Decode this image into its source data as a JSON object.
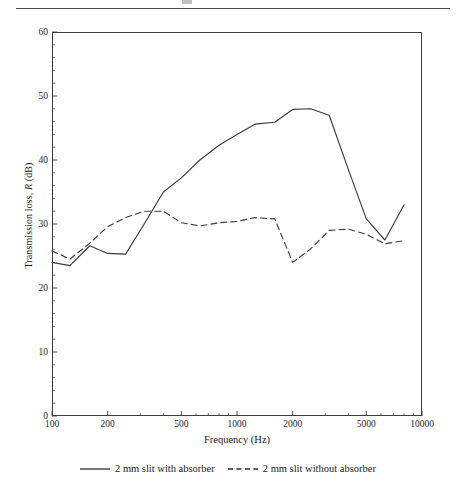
{
  "page": {
    "header_rule": true,
    "top_glyph": "cut-off-text-fragment"
  },
  "figure": {
    "x_axis_title": "Frequency (Hz)",
    "y_axis_title_pre": "Transmission loss, ",
    "y_axis_title_ital": "R",
    "y_axis_title_post": " (dB)"
  },
  "legend": {
    "items": [
      {
        "label": "2 mm slit with absorber",
        "style": "solid"
      },
      {
        "label": "2 mm slit without absorber",
        "style": "dashed"
      }
    ]
  },
  "chart_data": {
    "type": "line",
    "title": "",
    "xlabel": "Frequency (Hz)",
    "ylabel": "Transmission loss, R (dB)",
    "xscale": "log",
    "xlim": [
      100,
      10000
    ],
    "ylim": [
      0,
      60
    ],
    "yticks": [
      0,
      10,
      20,
      30,
      40,
      50,
      60
    ],
    "xticks": [
      100,
      200,
      500,
      1000,
      2000,
      5000,
      10000
    ],
    "xticklabels": [
      "100",
      "200",
      "500",
      "1000",
      "2000",
      "5000",
      "10000"
    ],
    "grid": false,
    "legend_position": "below-axes",
    "x": [
      100,
      125,
      160,
      200,
      250,
      315,
      400,
      500,
      630,
      800,
      1000,
      1250,
      1600,
      2000,
      2500,
      3150,
      4000,
      5000,
      6300,
      8000
    ],
    "series": [
      {
        "name": "2 mm slit with absorber",
        "style": "solid",
        "color": "#3c3c3c",
        "values": [
          24.0,
          23.5,
          26.6,
          25.4,
          25.3,
          30.0,
          35.0,
          37.2,
          40.0,
          42.3,
          44.0,
          45.6,
          45.9,
          47.9,
          48.0,
          47.0,
          38.5,
          30.8,
          27.5,
          33.0
        ]
      },
      {
        "name": "2 mm slit without absorber",
        "style": "dashed",
        "color": "#3c3c3c",
        "values": [
          25.8,
          24.5,
          27.0,
          29.6,
          31.0,
          32.0,
          32.0,
          30.2,
          29.7,
          30.2,
          30.4,
          31.0,
          30.8,
          24.0,
          26.1,
          29.0,
          29.2,
          28.4,
          26.9,
          27.4
        ]
      }
    ]
  }
}
